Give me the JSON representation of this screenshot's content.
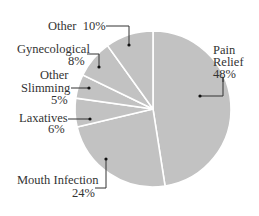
{
  "chart_data": {
    "type": "pie",
    "title": "",
    "start_angle_deg": 0,
    "direction": "clockwise",
    "slice_color": "#c2c2c2",
    "separator_color": "#ffffff",
    "slices": [
      {
        "label": "Pain Relief",
        "value": 48,
        "text": [
          "Pain",
          "Relief",
          "48%"
        ]
      },
      {
        "label": "Mouth Infection",
        "value": 24,
        "text": [
          "Mouth Infection",
          "24%"
        ]
      },
      {
        "label": "Laxatives",
        "value": 6,
        "text": [
          "Laxatives",
          "6%"
        ]
      },
      {
        "label": "Other Slimming",
        "value": 5,
        "text": [
          "Other",
          "Slimming",
          "5%"
        ]
      },
      {
        "label": "Gynecological",
        "value": 8,
        "text": [
          "Gynecological",
          "8%"
        ]
      },
      {
        "label": "Other",
        "value": 10,
        "text": [
          "Other  10%"
        ]
      }
    ]
  },
  "labels": {
    "pain_relief": {
      "line1": "Pain",
      "line2": "Relief",
      "pct": "48%"
    },
    "mouth_infection": {
      "line1": "Mouth Infection",
      "pct": "24%"
    },
    "laxatives": {
      "line1": "Laxatives",
      "pct": "6%"
    },
    "other_slimming": {
      "line1": "Other",
      "line2": "Slimming",
      "pct": "5%"
    },
    "gynecological": {
      "line1": "Gynecological",
      "pct": "8%"
    },
    "other": {
      "line1": "Other  10%"
    }
  }
}
